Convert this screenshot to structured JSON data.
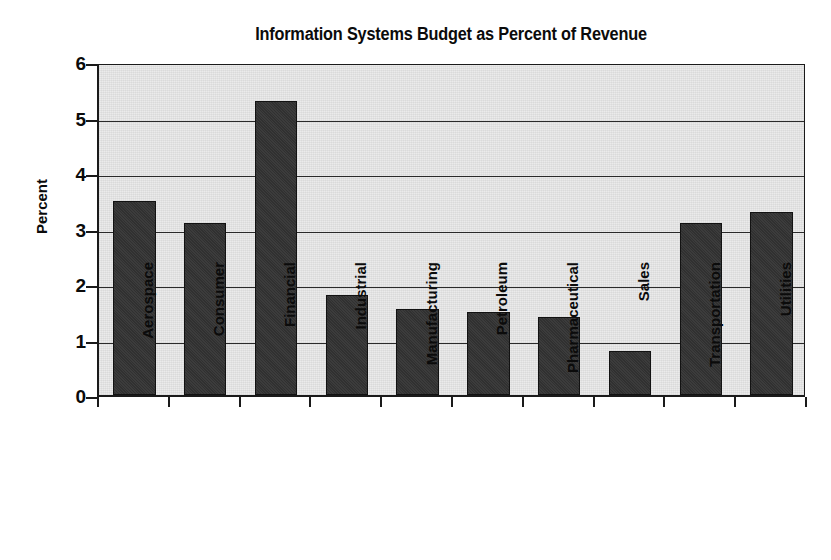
{
  "chart_data": {
    "type": "bar",
    "title": "Information Systems Budget as Percent of Revenue",
    "xlabel": "",
    "ylabel": "Percent",
    "categories": [
      "Aerospace",
      "Consumer",
      "Financial",
      "Industrial",
      "Manufacturing",
      "Petroleum",
      "Pharmaceutical",
      "Sales",
      "Transportation",
      "Utilities"
    ],
    "values": [
      3.5,
      3.1,
      5.3,
      1.8,
      1.55,
      1.5,
      1.4,
      0.8,
      3.1,
      3.3
    ],
    "ylim": [
      0,
      6
    ],
    "ytick_labels": [
      "6",
      "5",
      "4",
      "3",
      "2",
      "1",
      "0"
    ],
    "ytick_values": [
      6,
      5,
      4,
      3,
      2,
      1,
      0
    ],
    "grid": true,
    "legend": false,
    "legend_position": "none",
    "colors": {
      "bar_fill": "#333333",
      "bar_edge": "#121212",
      "plot_background": "#e9e9e9",
      "gridline": "#2a2a2a",
      "axis": "#1a1a1a",
      "text": "#0b0b0b",
      "page_background": "#ffffff"
    }
  }
}
